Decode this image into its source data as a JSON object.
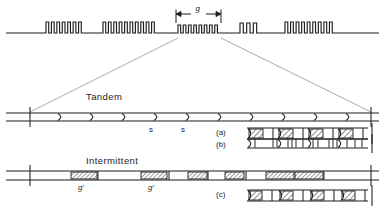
{
  "figure": {
    "title": "",
    "background": "#ffffff",
    "ink": "#1d1d1d",
    "hatch_color": "#2a2a2a",
    "leader_color": "#9a9a9a"
  },
  "top_trace": {
    "name": "signal-trace",
    "baseline_y": 33,
    "x_start": 6,
    "x_end": 379,
    "bursts": [
      {
        "id": "burst-1",
        "x": 46,
        "width": 38,
        "cycles": 7,
        "amplitude": 11
      },
      {
        "id": "burst-2",
        "x": 103,
        "width": 54,
        "cycles": 10,
        "amplitude": 11
      },
      {
        "id": "burst-3",
        "x": 178,
        "width": 42,
        "cycles": 8,
        "amplitude": 8
      },
      {
        "id": "burst-4",
        "x": 240,
        "width": 20,
        "cycles": 3,
        "amplitude": 10
      },
      {
        "id": "burst-5",
        "x": 285,
        "width": 50,
        "cycles": 9,
        "amplitude": 11
      }
    ],
    "dimension": {
      "label": "g",
      "x_left": 176,
      "x_right": 221,
      "y": 14
    }
  },
  "expansion": {
    "from_left_x": 178,
    "from_right_x": 221,
    "from_y": 38,
    "to_left_x": 30,
    "to_right_x": 371,
    "to_y": 112
  },
  "tandem": {
    "title": "Tandem",
    "title_x": 86,
    "title_y": 91,
    "track": {
      "x_start": 6,
      "x_end": 379,
      "y_top": 113,
      "y_bottom": 121,
      "end_tick_left_x": 30,
      "end_tick_right_x": 371
    },
    "chevrons": [
      58,
      90,
      122,
      154,
      186,
      218,
      250,
      282,
      314,
      346
    ],
    "s_labels": [
      {
        "text": "s",
        "x": 149,
        "y": 125
      },
      {
        "text": "s",
        "x": 181,
        "y": 125
      }
    ],
    "rows": [
      {
        "id": "row-a",
        "label": "(a)",
        "label_x": 216,
        "label_y": 128,
        "y_top": 128,
        "y_bottom": 139,
        "x_start": 247,
        "x_end": 368,
        "kind": "hatched-blocks",
        "blocks": [
          {
            "x": 249,
            "width": 14
          },
          {
            "x": 279,
            "width": 14
          },
          {
            "x": 309,
            "width": 14
          },
          {
            "x": 339,
            "width": 14
          }
        ],
        "dividers": [
          273,
          303,
          333,
          363
        ],
        "chevrons": [
          248,
          278,
          308,
          338
        ]
      },
      {
        "id": "row-b",
        "label": "(b)",
        "label_x": 216,
        "label_y": 140,
        "y_top": 139,
        "y_bottom": 148,
        "x_start": 247,
        "x_end": 368,
        "kind": "tick-groups",
        "chevrons": [
          248,
          278,
          308,
          338
        ],
        "ticks": [
          255,
          273,
          277,
          288,
          292,
          296,
          303,
          313,
          318,
          329,
          333,
          337,
          347,
          355,
          362
        ]
      }
    ]
  },
  "intermittent": {
    "title": "Intermittent",
    "title_x": 86,
    "title_y": 155,
    "track": {
      "x_start": 6,
      "x_end": 379,
      "y_top": 171,
      "y_bottom": 180,
      "end_tick_left_x": 30,
      "end_tick_right_x": 371
    },
    "segments": [
      {
        "x": 71,
        "width": 26,
        "divider": 98
      },
      {
        "x": 141,
        "width": 26,
        "divider": 169
      },
      {
        "x": 188,
        "width": 19,
        "divider": 208
      },
      {
        "x": 225,
        "width": 19,
        "divider": 246
      },
      {
        "x": 266,
        "width": 28
      },
      {
        "x": 295,
        "width": 28,
        "divider": 324
      }
    ],
    "g_labels": [
      {
        "text": "g'",
        "x": 78,
        "y": 183
      },
      {
        "text": "g'",
        "x": 148,
        "y": 183
      }
    ],
    "rows": [
      {
        "id": "row-c",
        "label": "(c)",
        "label_x": 216,
        "label_y": 190,
        "y_top": 190,
        "y_bottom": 201,
        "x_start": 247,
        "x_end": 368,
        "kind": "hatched-blocks",
        "blocks": [
          {
            "x": 249,
            "width": 13
          },
          {
            "x": 280,
            "width": 13
          },
          {
            "x": 311,
            "width": 13
          },
          {
            "x": 342,
            "width": 13
          }
        ],
        "dividers": [
          272,
          303,
          334,
          365
        ],
        "chevrons": [
          248,
          279,
          310,
          341
        ]
      }
    ]
  }
}
